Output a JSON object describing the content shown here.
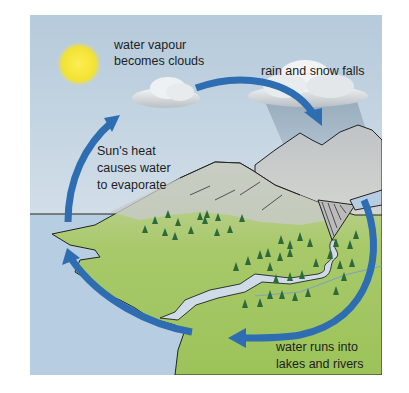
{
  "diagram": {
    "type": "water-cycle",
    "labels": {
      "evaporation": [
        "Sun's heat",
        "causes water",
        "to evaporate"
      ],
      "condensation": [
        "water vapour",
        "becomes clouds"
      ],
      "precipitation": [
        "rain and snow falls"
      ],
      "collection": [
        "water runs into",
        "lakes and rivers"
      ]
    },
    "colors": {
      "sky_top": "#b8cddd",
      "sky_bottom": "#e4ecf1",
      "sea": "#b7cde2",
      "land": "#9ec45a",
      "mountain": "#c9cccd",
      "arrow": "#2f6db3",
      "sun": "#f7e33a",
      "tree": "#2d6a3a"
    }
  }
}
